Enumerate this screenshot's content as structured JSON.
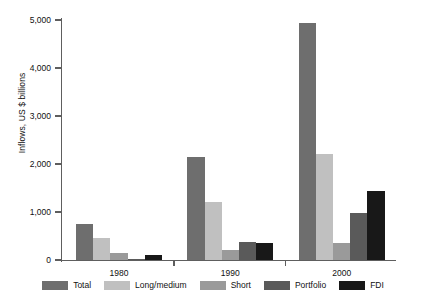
{
  "chart_data": {
    "type": "bar",
    "title": "",
    "subtitle": "",
    "xlabel": "",
    "ylabel": "Inflows, US $ billions",
    "categories": [
      "1980",
      "1990",
      "2000"
    ],
    "series": [
      {
        "name": "Total",
        "color": "#6e6e6e",
        "values": [
          760,
          2150,
          4940
        ]
      },
      {
        "name": "Long/medium",
        "color": "#c0c0c0",
        "values": [
          450,
          1210,
          2200
        ]
      },
      {
        "name": "Short",
        "color": "#9a9a9a",
        "values": [
          140,
          215,
          345
        ]
      },
      {
        "name": "Portfolio",
        "color": "#5a5a5a",
        "values": [
          20,
          385,
          975
        ]
      },
      {
        "name": "FDI",
        "color": "#181818",
        "values": [
          105,
          360,
          1440
        ]
      }
    ],
    "yticks": [
      0,
      1000,
      2000,
      3000,
      4000,
      5000
    ],
    "ytick_labels": [
      "0",
      "1,000",
      "2,000",
      "3,000",
      "4,000",
      "5,000"
    ],
    "ylim": [
      0,
      5000
    ],
    "grid": false,
    "legend_position": "bottom",
    "legend_entries": [
      "Total",
      "Long/medium",
      "Short",
      "Portfolio",
      "FDI"
    ]
  },
  "colors": {
    "axis": "#5e5e5e",
    "text": "#111111",
    "background": "#ffffff"
  }
}
